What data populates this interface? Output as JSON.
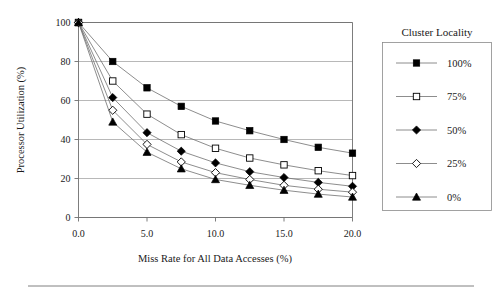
{
  "chart_data": {
    "type": "line",
    "title": "",
    "xlabel": "Miss Rate for All Data Accesses (%)",
    "ylabel": "Processor Utilization (%)",
    "xlim": [
      0.0,
      20.0
    ],
    "ylim": [
      0,
      100
    ],
    "xticks": [
      "0.0",
      "5.0",
      "10.0",
      "15.0",
      "20.0"
    ],
    "xtick_values": [
      0.0,
      5.0,
      10.0,
      15.0,
      20.0
    ],
    "yticks": [
      "0",
      "20",
      "40",
      "60",
      "80",
      "100"
    ],
    "ytick_values": [
      0,
      20,
      40,
      60,
      80,
      100
    ],
    "grid": "horizontal",
    "legend_position": "right-outside",
    "legend_title": "Cluster Locality",
    "x": [
      0.0,
      2.5,
      5.0,
      7.5,
      10.0,
      12.5,
      15.0,
      17.5,
      20.0
    ],
    "series": [
      {
        "name": "100%",
        "marker": "filled-square",
        "values": [
          100,
          80,
          66.5,
          57,
          49.5,
          44.5,
          40,
          36,
          33
        ]
      },
      {
        "name": "75%",
        "marker": "open-square",
        "values": [
          100,
          70,
          53,
          42.5,
          35.5,
          30.5,
          27,
          24,
          21.5
        ]
      },
      {
        "name": "50%",
        "marker": "filled-diamond",
        "values": [
          100,
          61.5,
          43.5,
          34,
          28,
          23.5,
          20.5,
          18,
          16
        ]
      },
      {
        "name": "25%",
        "marker": "open-diamond",
        "values": [
          100,
          55,
          37.5,
          28.5,
          23,
          19.5,
          16.5,
          14.5,
          13
        ]
      },
      {
        "name": "0%",
        "marker": "filled-triangle",
        "values": [
          100,
          49,
          33.5,
          25,
          19.5,
          16.5,
          14,
          12,
          10.5
        ]
      }
    ]
  },
  "legend": {
    "title": "Cluster Locality",
    "entries": [
      {
        "label": "100%",
        "marker": "filled-square"
      },
      {
        "label": "75%",
        "marker": "open-square"
      },
      {
        "label": "50%",
        "marker": "filled-diamond"
      },
      {
        "label": "25%",
        "marker": "open-diamond"
      },
      {
        "label": "0%",
        "marker": "filled-triangle"
      }
    ]
  },
  "colors": {
    "marker": "#000000",
    "line": "#707070",
    "grid": "#9a9a9a",
    "frame": "#6e6e6e",
    "background": "#ffffff"
  }
}
